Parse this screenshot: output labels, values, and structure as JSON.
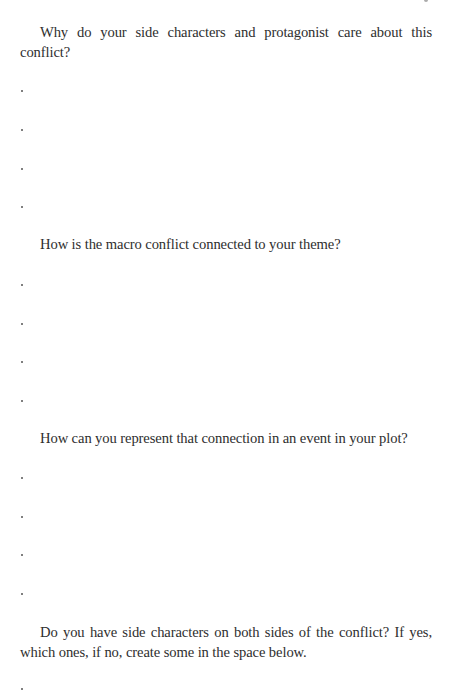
{
  "document": {
    "sections": [
      {
        "question": "Why do your side characters and protagonist care about this conflict?",
        "answer_lines": [
          ".",
          ".",
          ".",
          "."
        ]
      },
      {
        "question": "How is the macro conflict connected to your theme?",
        "answer_lines": [
          ".",
          ".",
          ".",
          "."
        ]
      },
      {
        "question": "How can you represent that connection in an event in your plot?",
        "answer_lines": [
          ".",
          ".",
          ".",
          "."
        ]
      },
      {
        "question": "Do you have side characters on both sides of the conflict? If yes, which ones, if no, create some in the space below.",
        "answer_lines": [
          "."
        ]
      }
    ]
  }
}
